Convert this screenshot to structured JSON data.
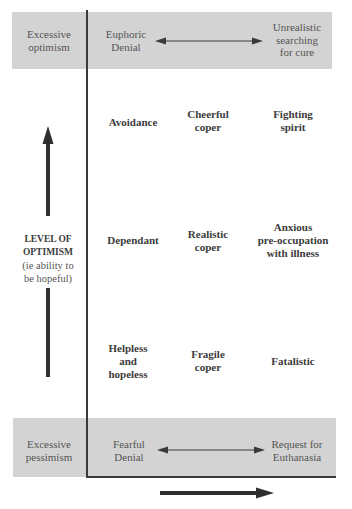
{
  "diagram": {
    "type": "coping-styles-grid",
    "y_axis": {
      "label_line1": "LEVEL OF",
      "label_line2": "OPTIMISM",
      "sublabel_line1": "(ie ability to",
      "sublabel_line2": "be hopeful)",
      "arrow_direction": "up"
    },
    "x_axis": {
      "label": "",
      "arrow_direction": "right"
    },
    "top_band": {
      "row_label_line1": "Excessive",
      "row_label_line2": "optimism",
      "left_line1": "Euphoric",
      "left_line2": "Denial",
      "right_line1": "Unrealistic",
      "right_line2": "searching",
      "right_line3": "for cure",
      "connector": "double-arrow"
    },
    "grid": {
      "rows": [
        {
          "cells": [
            {
              "line1": "Avoidance"
            },
            {
              "line1": "Cheerful",
              "line2": "coper"
            },
            {
              "line1": "Fighting",
              "line2": "spirit"
            }
          ]
        },
        {
          "cells": [
            {
              "line1": "Dependant"
            },
            {
              "line1": "Realistic",
              "line2": "coper"
            },
            {
              "line1": "Anxious",
              "line2": "pre-occupation",
              "line3": "with illness"
            }
          ]
        },
        {
          "cells": [
            {
              "line1": "Helpless",
              "line2": "and",
              "line3": "hopeless"
            },
            {
              "line1": "Fragile",
              "line2": "coper"
            },
            {
              "line1": "Fatalistic"
            }
          ]
        }
      ]
    },
    "bottom_band": {
      "row_label_line1": "Excessive",
      "row_label_line2": "pessimism",
      "left_line1": "Fearful",
      "left_line2": "Denial",
      "right_line1": "Request for",
      "right_line2": "Euthanasia",
      "connector": "double-arrow"
    },
    "colors": {
      "band_fill": "#d3d3d3",
      "axis": "#3a3a3a",
      "text": "#3c3c3c"
    }
  }
}
